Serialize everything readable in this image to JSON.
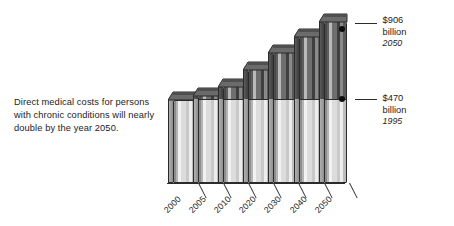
{
  "caption": {
    "text": "Direct medical costs for persons with chronic conditions will nearly double by the year 2050."
  },
  "chart_data": {
    "type": "bar",
    "title": "",
    "subtitle": "",
    "xlabel": "",
    "ylabel": "",
    "categories": [
      "2000",
      "2005",
      "2010",
      "2020",
      "2030",
      "2040",
      "2050"
    ],
    "values": [
      470,
      494,
      540,
      635,
      730,
      820,
      906
    ],
    "value_unit": "billions of dollars",
    "ylim": [
      0,
      1000
    ],
    "grid": false,
    "legend": null,
    "series": [
      {
        "name": "Direct medical costs for persons with chronic conditions",
        "values": [
          470,
          494,
          540,
          635,
          730,
          820,
          906
        ]
      }
    ],
    "threshold_line": {
      "label": "1995 baseline",
      "value": 470
    },
    "annotations": [
      {
        "amount": "$906",
        "unit": "billion",
        "year": "2050",
        "target_category": "2050",
        "target_value": 906
      },
      {
        "amount": "$470",
        "unit": "billion",
        "year": "1995",
        "target_category": "2050",
        "target_value": 470
      }
    ],
    "style": {
      "bar_dark_tone": "#4a4a4a",
      "bar_light_tone": "#dcdcdc",
      "outline": "#2b2b2b",
      "background": "#ffffff"
    }
  }
}
